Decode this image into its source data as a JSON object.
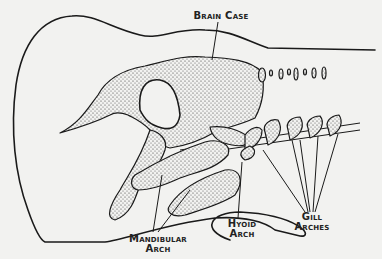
{
  "figure": {
    "labels": {
      "brain_case": "Brain Case",
      "mandibular_arch_line1": "Mandibular",
      "mandibular_arch_line2": "Arch",
      "hyoid_arch_line1": "Hyoid",
      "hyoid_arch_line2": "Arch",
      "gill_arches_line1": "Gill",
      "gill_arches_line2": "Arches"
    },
    "colors": {
      "background": "#f2f2f0",
      "ink": "#1a1a1a"
    }
  }
}
